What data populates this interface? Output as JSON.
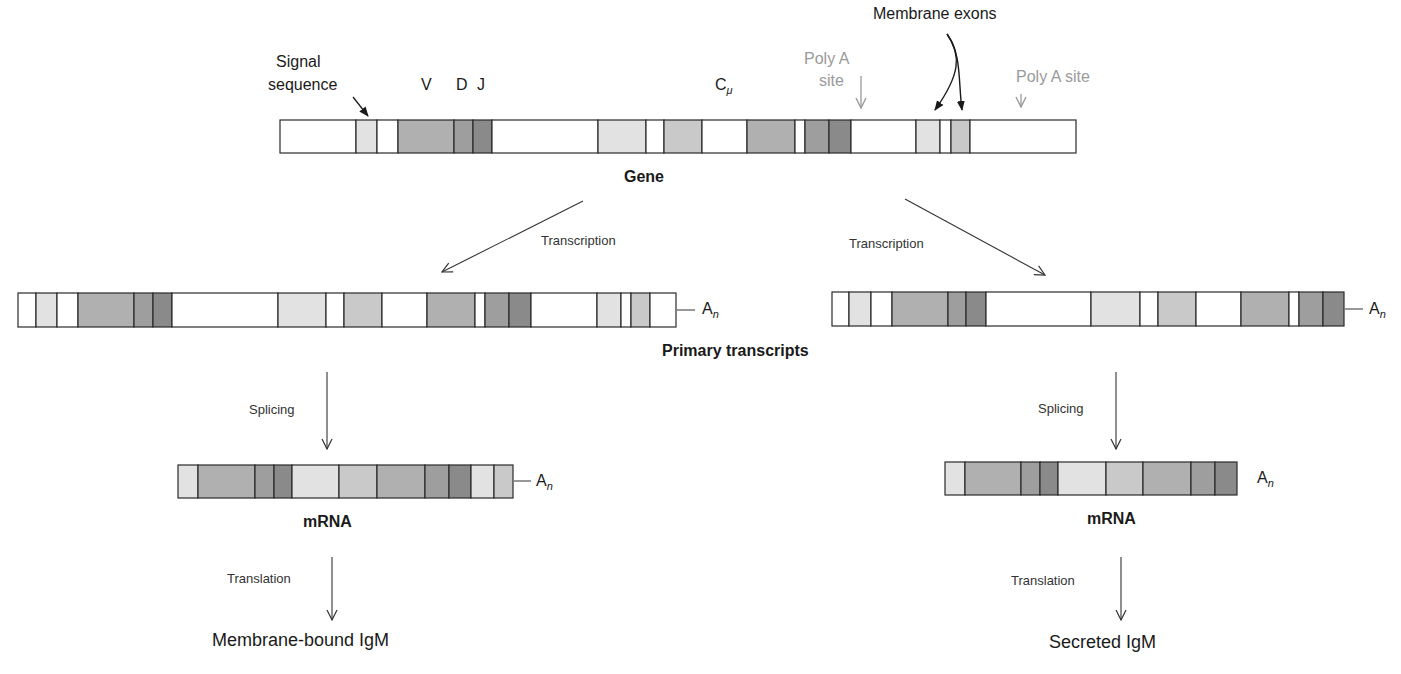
{
  "colors": {
    "white": "#ffffff",
    "light": "#e2e2e2",
    "medlight": "#c9c9c9",
    "mid": "#b0b0b0",
    "darkmid": "#9e9e9e",
    "dark": "#8a8a8a",
    "stroke": "#2a2a2a",
    "poly_a_gray": "#9a9a9a"
  },
  "gene": {
    "label": "Gene",
    "bar": {
      "x": 280,
      "y": 120,
      "w": 796,
      "h": 33
    },
    "segments": [
      {
        "x0": 280,
        "x1": 356,
        "fill": "white"
      },
      {
        "x0": 356,
        "x1": 377,
        "fill": "light"
      },
      {
        "x0": 377,
        "x1": 398,
        "fill": "white"
      },
      {
        "x0": 398,
        "x1": 454,
        "fill": "mid"
      },
      {
        "x0": 454,
        "x1": 473,
        "fill": "darkmid"
      },
      {
        "x0": 473,
        "x1": 492,
        "fill": "dark"
      },
      {
        "x0": 492,
        "x1": 598,
        "fill": "white"
      },
      {
        "x0": 598,
        "x1": 646,
        "fill": "light"
      },
      {
        "x0": 646,
        "x1": 664,
        "fill": "white"
      },
      {
        "x0": 664,
        "x1": 702,
        "fill": "medlight"
      },
      {
        "x0": 702,
        "x1": 747,
        "fill": "white"
      },
      {
        "x0": 747,
        "x1": 795,
        "fill": "mid"
      },
      {
        "x0": 795,
        "x1": 805,
        "fill": "white"
      },
      {
        "x0": 805,
        "x1": 829,
        "fill": "darkmid"
      },
      {
        "x0": 829,
        "x1": 851,
        "fill": "dark"
      },
      {
        "x0": 851,
        "x1": 916,
        "fill": "white"
      },
      {
        "x0": 916,
        "x1": 940,
        "fill": "light"
      },
      {
        "x0": 940,
        "x1": 951,
        "fill": "white"
      },
      {
        "x0": 951,
        "x1": 970,
        "fill": "medlight"
      },
      {
        "x0": 970,
        "x1": 1076,
        "fill": "white"
      }
    ],
    "annotations": {
      "signal_line1": "Signal",
      "signal_line2": "sequence",
      "v": "V",
      "d": "D",
      "j": "J",
      "c": "C",
      "c_sub": "μ",
      "poly_a_1_line1": "Poly A",
      "poly_a_1_line2": "site",
      "poly_a_2": "Poly A site",
      "membrane_exons": "Membrane exons"
    }
  },
  "transcription": {
    "left_label": "Transcription",
    "right_label": "Transcription"
  },
  "primary_transcripts": {
    "label": "Primary transcripts",
    "left": {
      "bar": {
        "x": 18,
        "y": 293,
        "w": 658,
        "h": 34
      },
      "tail": "A",
      "tail_sub": "n",
      "segments": [
        {
          "x0": 18,
          "x1": 36,
          "fill": "white"
        },
        {
          "x0": 36,
          "x1": 57,
          "fill": "light"
        },
        {
          "x0": 57,
          "x1": 78,
          "fill": "white"
        },
        {
          "x0": 78,
          "x1": 134,
          "fill": "mid"
        },
        {
          "x0": 134,
          "x1": 153,
          "fill": "darkmid"
        },
        {
          "x0": 153,
          "x1": 172,
          "fill": "dark"
        },
        {
          "x0": 172,
          "x1": 278,
          "fill": "white"
        },
        {
          "x0": 278,
          "x1": 326,
          "fill": "light"
        },
        {
          "x0": 326,
          "x1": 344,
          "fill": "white"
        },
        {
          "x0": 344,
          "x1": 382,
          "fill": "medlight"
        },
        {
          "x0": 382,
          "x1": 427,
          "fill": "white"
        },
        {
          "x0": 427,
          "x1": 475,
          "fill": "mid"
        },
        {
          "x0": 475,
          "x1": 485,
          "fill": "white"
        },
        {
          "x0": 485,
          "x1": 509,
          "fill": "darkmid"
        },
        {
          "x0": 509,
          "x1": 531,
          "fill": "dark"
        },
        {
          "x0": 531,
          "x1": 597,
          "fill": "white"
        },
        {
          "x0": 597,
          "x1": 621,
          "fill": "light"
        },
        {
          "x0": 621,
          "x1": 631,
          "fill": "white"
        },
        {
          "x0": 631,
          "x1": 650,
          "fill": "medlight"
        },
        {
          "x0": 650,
          "x1": 676,
          "fill": "white"
        }
      ]
    },
    "right": {
      "bar": {
        "x": 832,
        "y": 292,
        "w": 512,
        "h": 34
      },
      "tail": "A",
      "tail_sub": "n",
      "segments": [
        {
          "x0": 832,
          "x1": 849,
          "fill": "white"
        },
        {
          "x0": 849,
          "x1": 871,
          "fill": "light"
        },
        {
          "x0": 871,
          "x1": 892,
          "fill": "white"
        },
        {
          "x0": 892,
          "x1": 948,
          "fill": "mid"
        },
        {
          "x0": 948,
          "x1": 966,
          "fill": "darkmid"
        },
        {
          "x0": 966,
          "x1": 986,
          "fill": "dark"
        },
        {
          "x0": 986,
          "x1": 1091,
          "fill": "white"
        },
        {
          "x0": 1091,
          "x1": 1140,
          "fill": "light"
        },
        {
          "x0": 1140,
          "x1": 1158,
          "fill": "white"
        },
        {
          "x0": 1158,
          "x1": 1196,
          "fill": "medlight"
        },
        {
          "x0": 1196,
          "x1": 1241,
          "fill": "white"
        },
        {
          "x0": 1241,
          "x1": 1289,
          "fill": "mid"
        },
        {
          "x0": 1289,
          "x1": 1299,
          "fill": "white"
        },
        {
          "x0": 1299,
          "x1": 1323,
          "fill": "darkmid"
        },
        {
          "x0": 1323,
          "x1": 1344,
          "fill": "dark"
        }
      ]
    }
  },
  "splicing": {
    "left_label": "Splicing",
    "right_label": "Splicing"
  },
  "mrna": {
    "left": {
      "label": "mRNA",
      "bar": {
        "x": 178,
        "y": 465,
        "w": 335,
        "h": 33
      },
      "tail": "A",
      "tail_sub": "n",
      "segments": [
        {
          "x0": 178,
          "x1": 198,
          "fill": "light"
        },
        {
          "x0": 198,
          "x1": 255,
          "fill": "mid"
        },
        {
          "x0": 255,
          "x1": 274,
          "fill": "darkmid"
        },
        {
          "x0": 274,
          "x1": 292,
          "fill": "dark"
        },
        {
          "x0": 292,
          "x1": 339,
          "fill": "light"
        },
        {
          "x0": 339,
          "x1": 377,
          "fill": "medlight"
        },
        {
          "x0": 377,
          "x1": 425,
          "fill": "mid"
        },
        {
          "x0": 425,
          "x1": 449,
          "fill": "darkmid"
        },
        {
          "x0": 449,
          "x1": 471,
          "fill": "dark"
        },
        {
          "x0": 471,
          "x1": 494,
          "fill": "light"
        },
        {
          "x0": 494,
          "x1": 513,
          "fill": "medlight"
        }
      ]
    },
    "right": {
      "label": "mRNA",
      "bar": {
        "x": 945,
        "y": 462,
        "w": 292,
        "h": 33
      },
      "tail": "A",
      "tail_sub": "n",
      "segments": [
        {
          "x0": 945,
          "x1": 965,
          "fill": "light"
        },
        {
          "x0": 965,
          "x1": 1021,
          "fill": "mid"
        },
        {
          "x0": 1021,
          "x1": 1040,
          "fill": "darkmid"
        },
        {
          "x0": 1040,
          "x1": 1058,
          "fill": "dark"
        },
        {
          "x0": 1058,
          "x1": 1106,
          "fill": "light"
        },
        {
          "x0": 1106,
          "x1": 1143,
          "fill": "medlight"
        },
        {
          "x0": 1143,
          "x1": 1191,
          "fill": "mid"
        },
        {
          "x0": 1191,
          "x1": 1215,
          "fill": "darkmid"
        },
        {
          "x0": 1215,
          "x1": 1237,
          "fill": "dark"
        }
      ]
    }
  },
  "translation": {
    "left_label": "Translation",
    "right_label": "Translation"
  },
  "products": {
    "left": "Membrane-bound IgM",
    "right": "Secreted IgM"
  }
}
